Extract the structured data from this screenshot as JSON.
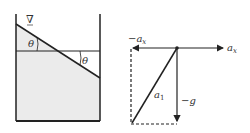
{
  "tank": {
    "free_surface_symbol": "∇",
    "angle_label_left": "θ",
    "angle_label_right": "θ",
    "colors": {
      "fluid": "#ebebeb",
      "wall": "#222222"
    }
  },
  "vector_diagram": {
    "neg_ax_label": "−a",
    "neg_ax_sub": "x",
    "ax_label": "a",
    "ax_sub": "x",
    "a1_label": "a",
    "a1_sub": "1",
    "neg_g_label": "−g"
  }
}
